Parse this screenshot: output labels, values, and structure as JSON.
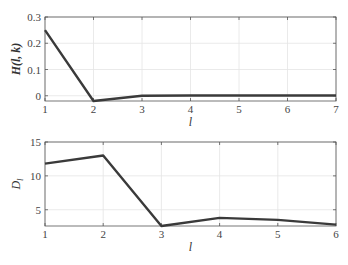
{
  "chart_data": [
    {
      "type": "line",
      "title": "",
      "xlabel": "l",
      "ylabel": "H(l, k)",
      "x": [
        1,
        2,
        3,
        4,
        5,
        6,
        7
      ],
      "series": [
        {
          "name": "H(l,k)",
          "values": [
            0.25,
            -0.02,
            0.0,
            0.001,
            0.001,
            0.001,
            0.001
          ]
        }
      ],
      "xlim": [
        1,
        7
      ],
      "ylim": [
        -0.02,
        0.3
      ],
      "xticks": [
        "1",
        "2",
        "3",
        "4",
        "5",
        "6",
        "7"
      ],
      "yticks": [
        "0",
        "0.1",
        "0.2",
        "0.3"
      ],
      "grid": true,
      "line_color": "#3a3a3a"
    },
    {
      "type": "line",
      "title": "",
      "xlabel": "l",
      "ylabel": "D_l",
      "x": [
        1,
        2,
        3,
        4,
        5,
        6
      ],
      "series": [
        {
          "name": "D_l",
          "values": [
            11.8,
            13.0,
            2.6,
            3.8,
            3.5,
            2.8
          ]
        }
      ],
      "xlim": [
        1,
        6
      ],
      "ylim": [
        2.6,
        15
      ],
      "xticks": [
        "1",
        "2",
        "3",
        "4",
        "5",
        "6"
      ],
      "yticks": [
        "5",
        "10",
        "15"
      ],
      "grid": true,
      "line_color": "#3a3a3a"
    }
  ]
}
